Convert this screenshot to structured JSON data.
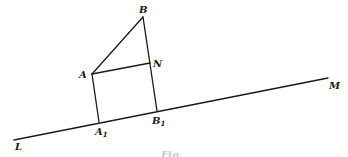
{
  "figure": {
    "width": 348,
    "height": 157,
    "stroke_color": "#1a1a1a",
    "background": "#ffffff"
  },
  "points": {
    "B": {
      "x": 143,
      "y": 17
    },
    "A": {
      "x": 92,
      "y": 74
    },
    "N": {
      "x": 150,
      "y": 63
    },
    "A1": {
      "x": 99,
      "y": 122
    },
    "B1": {
      "x": 157,
      "y": 111
    },
    "L": {
      "x": 14,
      "y": 140
    },
    "M": {
      "x": 328,
      "y": 78
    }
  },
  "segments": [
    {
      "name": "line-LM",
      "from": "L",
      "to": "M"
    },
    {
      "name": "segment-AB",
      "from": "A",
      "to": "B"
    },
    {
      "name": "segment-BB1",
      "from": "B",
      "to": "B1"
    },
    {
      "name": "segment-AN",
      "from": "A",
      "to": "N"
    },
    {
      "name": "segment-AA1",
      "from": "A",
      "to": "A1"
    }
  ],
  "labels": {
    "B": {
      "text": "B",
      "x": 139,
      "y": 13
    },
    "A": {
      "text": "A",
      "x": 79,
      "y": 78
    },
    "N": {
      "text": "N",
      "x": 153,
      "y": 67
    },
    "A1": {
      "text": "A",
      "sub": "1",
      "x": 95,
      "y": 135
    },
    "B1": {
      "text": "B",
      "sub": "1",
      "x": 152,
      "y": 124
    },
    "L": {
      "text": "L",
      "x": 15,
      "y": 150
    },
    "M": {
      "text": "M",
      "x": 329,
      "y": 89
    }
  },
  "caption": {
    "text": "Fig.",
    "x": 161,
    "y": 158
  }
}
